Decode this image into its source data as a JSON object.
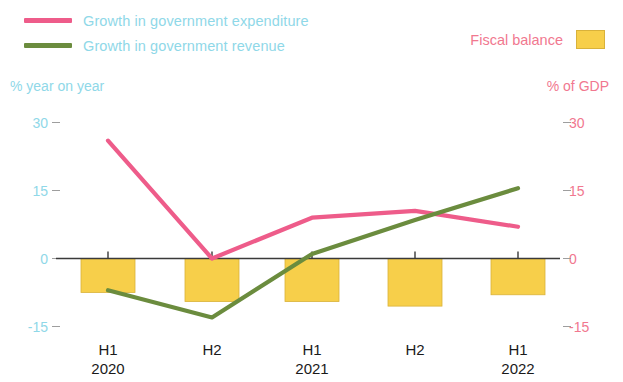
{
  "legend": {
    "expenditure": {
      "label": "Growth in government expenditure",
      "color": "#EE5C8A",
      "marker": "line-swatch"
    },
    "revenue": {
      "label": "Growth in government revenue",
      "color": "#6B8C3E",
      "marker": "line-swatch"
    },
    "fiscal_balance": {
      "label": "Fiscal balance",
      "color": "#F7CF4A",
      "marker": "box-swatch"
    }
  },
  "axes": {
    "left_caption": "% year on year",
    "right_caption": "% of GDP",
    "left_ticks": [
      "30",
      "15",
      "0",
      "-15"
    ],
    "right_ticks": [
      "30",
      "15",
      "0",
      "-15"
    ],
    "left_color": "#8FD8E8",
    "right_color": "#F1788F"
  },
  "x_labels": [
    {
      "period": "H1",
      "year": "2020"
    },
    {
      "period": "H2",
      "year": ""
    },
    {
      "period": "H1",
      "year": "2021"
    },
    {
      "period": "H2",
      "year": ""
    },
    {
      "period": "H1",
      "year": "2022"
    }
  ],
  "chart_data": {
    "type": "line",
    "title": "",
    "xlabel": "",
    "ylabel": "% year on year",
    "y2label": "% of GDP",
    "grid": false,
    "legend_position": "top",
    "categories": [
      "H1 2020",
      "H2 2020",
      "H1 2021",
      "H2 2021",
      "H1 2022"
    ],
    "ylim": [
      -17,
      32
    ],
    "y2lim": [
      -17,
      32
    ],
    "yticks": [
      -15,
      0,
      15,
      30
    ],
    "y2ticks": [
      -15,
      0,
      15,
      30
    ],
    "series": [
      {
        "name": "Growth in government expenditure",
        "type": "line",
        "axis": "left",
        "color": "#EE5C8A",
        "values": [
          26,
          0,
          9,
          10.5,
          7
        ]
      },
      {
        "name": "Growth in government revenue",
        "type": "line",
        "axis": "left",
        "color": "#6B8C3E",
        "values": [
          -7,
          -13,
          1,
          8.5,
          15.5
        ]
      },
      {
        "name": "Fiscal balance",
        "type": "bar",
        "axis": "right",
        "color": "#F7CF4A",
        "values": [
          -7.5,
          -9.5,
          -9.5,
          -10.5,
          -8
        ]
      }
    ]
  }
}
